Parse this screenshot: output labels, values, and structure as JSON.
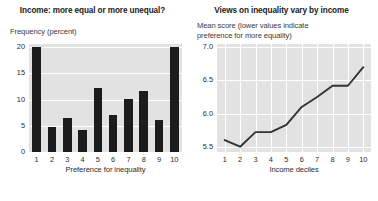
{
  "chart_data": [
    {
      "type": "bar",
      "title": "Income: more equal or more unequal?",
      "ylabel": "Frequency (percent)",
      "xlabel": "Preference for inequality",
      "categories": [
        "1",
        "2",
        "3",
        "4",
        "5",
        "6",
        "7",
        "8",
        "9",
        "10"
      ],
      "values": [
        20.0,
        4.8,
        6.4,
        4.2,
        12.3,
        7.1,
        10.1,
        11.6,
        6.1,
        20.0
      ],
      "yticks": [
        "0",
        "5",
        "10",
        "15",
        "20"
      ],
      "ytick_values": [
        0,
        5,
        10,
        15,
        20
      ],
      "ylim": [
        0,
        20.6
      ],
      "grid": "horizontal",
      "bar_color": "#1c1c1c",
      "plot_background": "#e2e2e2",
      "gridline_color": "#ffffff"
    },
    {
      "type": "line",
      "title": "Views on inequality vary by income",
      "ylabel": "Mean score (lower values indicate preference for more equality)",
      "ylabel_line1": "Mean score (lower values indicate",
      "ylabel_line2": "preference for more equality)",
      "xlabel": "Income deciles",
      "x": [
        "1",
        "2",
        "3",
        "4",
        "5",
        "6",
        "7",
        "8",
        "9",
        "10"
      ],
      "values": [
        5.6,
        5.5,
        5.72,
        5.72,
        5.83,
        6.1,
        6.25,
        6.42,
        6.42,
        6.7
      ],
      "yticks": [
        "5.5",
        "6.0",
        "6.5",
        "7.0"
      ],
      "ytick_values": [
        5.5,
        6.0,
        6.5,
        7.0
      ],
      "ylim": [
        5.42,
        7.05
      ],
      "grid": "both",
      "line_color": "#333333",
      "plot_background": "#e2e2e2",
      "gridline_color": "#ffffff"
    }
  ]
}
